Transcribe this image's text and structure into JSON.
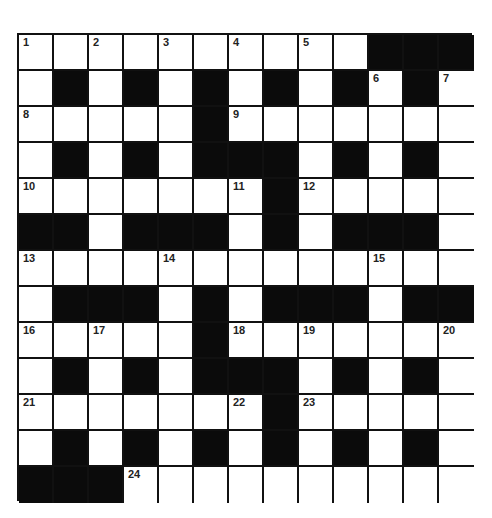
{
  "puzzle": {
    "rows": 13,
    "cols": 13,
    "colors": {
      "block": "#0b0b0b",
      "cell": "#ffffff",
      "line": "#111111"
    },
    "layout": [
      "..........###",
      ".#.#.#.#.#.#.",
      ".....#.......",
      ".#.#.###.#.#.",
      ".......#.....",
      "##.###.#.###.",
      ".............",
      ".###.#.###.##",
      ".....#.......",
      ".#.#.###.#.#.",
      ".......#.....",
      ".#.#.#.#.#.#.",
      "###.........."
    ],
    "numbers": [
      {
        "r": 0,
        "c": 0,
        "n": "1"
      },
      {
        "r": 0,
        "c": 2,
        "n": "2"
      },
      {
        "r": 0,
        "c": 4,
        "n": "3"
      },
      {
        "r": 0,
        "c": 6,
        "n": "4"
      },
      {
        "r": 0,
        "c": 8,
        "n": "5"
      },
      {
        "r": 1,
        "c": 10,
        "n": "6"
      },
      {
        "r": 1,
        "c": 12,
        "n": "7"
      },
      {
        "r": 2,
        "c": 0,
        "n": "8"
      },
      {
        "r": 2,
        "c": 6,
        "n": "9"
      },
      {
        "r": 4,
        "c": 0,
        "n": "10"
      },
      {
        "r": 4,
        "c": 6,
        "n": "11"
      },
      {
        "r": 4,
        "c": 8,
        "n": "12"
      },
      {
        "r": 6,
        "c": 0,
        "n": "13"
      },
      {
        "r": 6,
        "c": 4,
        "n": "14"
      },
      {
        "r": 6,
        "c": 10,
        "n": "15"
      },
      {
        "r": 8,
        "c": 0,
        "n": "16"
      },
      {
        "r": 8,
        "c": 2,
        "n": "17"
      },
      {
        "r": 8,
        "c": 6,
        "n": "18"
      },
      {
        "r": 8,
        "c": 8,
        "n": "19"
      },
      {
        "r": 8,
        "c": 12,
        "n": "20"
      },
      {
        "r": 10,
        "c": 0,
        "n": "21"
      },
      {
        "r": 10,
        "c": 6,
        "n": "22"
      },
      {
        "r": 10,
        "c": 8,
        "n": "23"
      },
      {
        "r": 12,
        "c": 3,
        "n": "24"
      }
    ]
  }
}
